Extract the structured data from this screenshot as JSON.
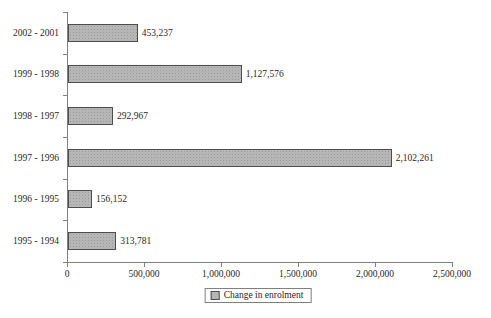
{
  "chart_data": {
    "type": "bar",
    "orientation": "horizontal",
    "title": "",
    "categories": [
      "2002 - 2001",
      "1999 - 1998",
      "1998 - 1997",
      "1997 - 1996",
      "1996 - 1995",
      "1995 - 1994"
    ],
    "values": [
      453237,
      1127576,
      292967,
      2102261,
      156152,
      313781
    ],
    "value_labels": [
      "453,237",
      "1,127,576",
      "292,967",
      "2,102,261",
      "156,152",
      "313,781"
    ],
    "xlabel": "",
    "ylabel": "",
    "xlim": [
      0,
      2500000
    ],
    "x_tick_values": [
      0,
      500000,
      1000000,
      1500000,
      2000000,
      2500000
    ],
    "x_tick_labels": [
      "0",
      "500,000",
      "1,000,000",
      "1,500,000",
      "2,000,000",
      "2,500,000"
    ],
    "grid": false,
    "legend": {
      "label": "Change in enrolment",
      "position": "bottom-center",
      "boxed": true
    },
    "colors": {
      "bar_fill": "#b6b6b6",
      "bar_border": "#4d4d4d",
      "axis": "#7f7f7f",
      "text": "#1f1f1f",
      "background": "#ffffff"
    }
  }
}
